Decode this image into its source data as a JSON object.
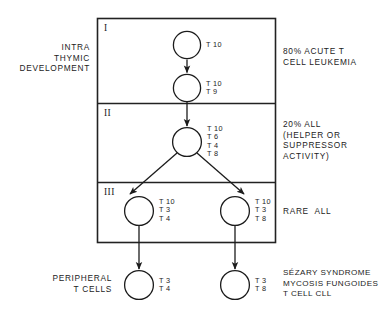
{
  "figure": {
    "stages": [
      {
        "id": "stage-1",
        "numeral": "I"
      },
      {
        "id": "stage-2",
        "numeral": "II"
      },
      {
        "id": "stage-3",
        "numeral": "III"
      }
    ],
    "left_labels": [
      {
        "id": "intrathymic",
        "lines": "INTRA\nTHYMIC\nDEVELOPMENT"
      },
      {
        "id": "peripheral",
        "lines": "PERIPHERAL\nT CELLS"
      }
    ],
    "right_labels": [
      {
        "id": "acute-t-cell-leukemia",
        "lines": "80% ACUTE T\nCELL LEUKEMIA"
      },
      {
        "id": "all-helper-suppressor",
        "lines": "20% ALL\n(HELPER OR\nSUPPRESSOR\nACTIVITY)"
      },
      {
        "id": "rare-all",
        "lines": "RARE  ALL"
      },
      {
        "id": "sezary-mycosis-cll",
        "lines": "SÉZARY SYNDROME\nMYCOSIS FUNGOIDES\nT CELL CLL"
      }
    ],
    "cells": [
      {
        "id": "cell-stage1-top",
        "markers": "T 10"
      },
      {
        "id": "cell-stage1-bottom",
        "markers": "T 10\nT 9"
      },
      {
        "id": "cell-stage2",
        "markers": "T 10\nT 6\nT 4\nT 8"
      },
      {
        "id": "cell-stage3-left",
        "markers": "T 10\nT 3\nT 4"
      },
      {
        "id": "cell-stage3-right",
        "markers": "T 10\nT 3\nT 8"
      },
      {
        "id": "cell-peripheral-left",
        "markers": "T 3\nT 4"
      },
      {
        "id": "cell-peripheral-right",
        "markers": "T 3\nT 8"
      }
    ],
    "colors": {
      "ink": "#1c1c1c",
      "background": "#ffffff",
      "stroke": "#222222"
    }
  }
}
